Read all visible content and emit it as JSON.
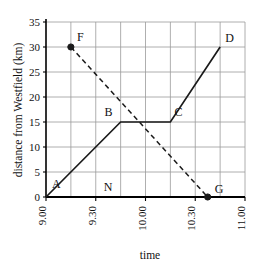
{
  "chart_data": {
    "type": "line",
    "title": "",
    "xlabel": "time",
    "ylabel": "distance from Westfield (km)",
    "xlim": [
      9.0,
      11.0
    ],
    "ylim": [
      0,
      35
    ],
    "grid": true,
    "legend": "none",
    "y_ticks": [
      0,
      5,
      10,
      15,
      20,
      25,
      30,
      35
    ],
    "y_tick_labels": [
      "0",
      "5",
      "10",
      "15",
      "20",
      "25",
      "30",
      "35"
    ],
    "x_ticks": [
      9.0,
      9.5,
      10.0,
      10.5,
      11.0
    ],
    "x_tick_labels": [
      "9.00",
      "9.30",
      "10.00",
      "10.30",
      "11.00"
    ],
    "x_minor_ticks": [
      9.25,
      9.75,
      10.25,
      10.75
    ],
    "series": [
      {
        "name": "solid-journey",
        "style": "solid",
        "points": [
          {
            "label": "A",
            "x": 9.0,
            "y": 0
          },
          {
            "label": "B",
            "x": 9.75,
            "y": 15
          },
          {
            "label": "C",
            "x": 10.25,
            "y": 15
          },
          {
            "label": "D",
            "x": 10.75,
            "y": 30
          }
        ]
      },
      {
        "name": "dashed-journey",
        "style": "dashed",
        "points": [
          {
            "label": "F",
            "x": 9.25,
            "y": 30
          },
          {
            "label": "G",
            "x": 10.625,
            "y": 0
          }
        ]
      }
    ],
    "markers": [
      {
        "label": "F",
        "x": 9.25,
        "y": 30,
        "filled": true
      },
      {
        "label": "G",
        "x": 10.625,
        "y": 0,
        "filled": true
      }
    ],
    "point_labels": [
      {
        "text": "A",
        "x": 9.0,
        "y": 0,
        "dx": 6,
        "dy": -9
      },
      {
        "text": "B",
        "x": 9.75,
        "y": 15,
        "dx": -8,
        "dy": -6
      },
      {
        "text": "C",
        "x": 10.25,
        "y": 15,
        "dx": 4,
        "dy": -6
      },
      {
        "text": "D",
        "x": 10.75,
        "y": 30,
        "dx": 5,
        "dy": -5
      },
      {
        "text": "F",
        "x": 9.25,
        "y": 30,
        "dx": 6,
        "dy": -6
      },
      {
        "text": "G",
        "x": 10.625,
        "y": 0,
        "dx": 7,
        "dy": -4
      },
      {
        "text": "N",
        "x": 9.625,
        "y": 0,
        "dx": 0,
        "dy": -6
      }
    ]
  },
  "axis_labels": {
    "y_title": "distance from Westfield (km)",
    "x_title": "time"
  },
  "colors": {
    "plot_line": "#1a1a1a",
    "grid": "#9a9a9a",
    "axis": "#000000",
    "background": "#ffffff",
    "text": "#111111"
  }
}
